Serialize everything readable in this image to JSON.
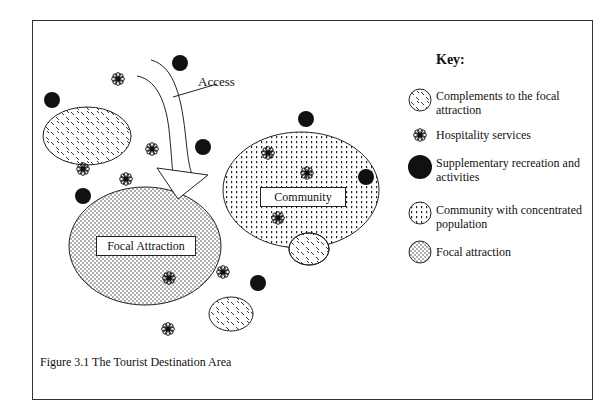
{
  "diagram": {
    "caption": "Figure 3.1  The Tourist Destination Area",
    "access_label": "Access",
    "focal_label": "Focal Attraction",
    "community_label": "Community",
    "key": {
      "title": "Key:",
      "items": [
        {
          "symbol": "complements-pattern",
          "label": "Complements to the focal attraction"
        },
        {
          "symbol": "hospitality-flower",
          "label": "Hospitality services"
        },
        {
          "symbol": "black-circle",
          "label": "Supplementary recreation and activities"
        },
        {
          "symbol": "community-pattern",
          "label": "Community with concentrated population"
        },
        {
          "symbol": "focal-pattern",
          "label": "Focal attraction"
        }
      ]
    }
  }
}
